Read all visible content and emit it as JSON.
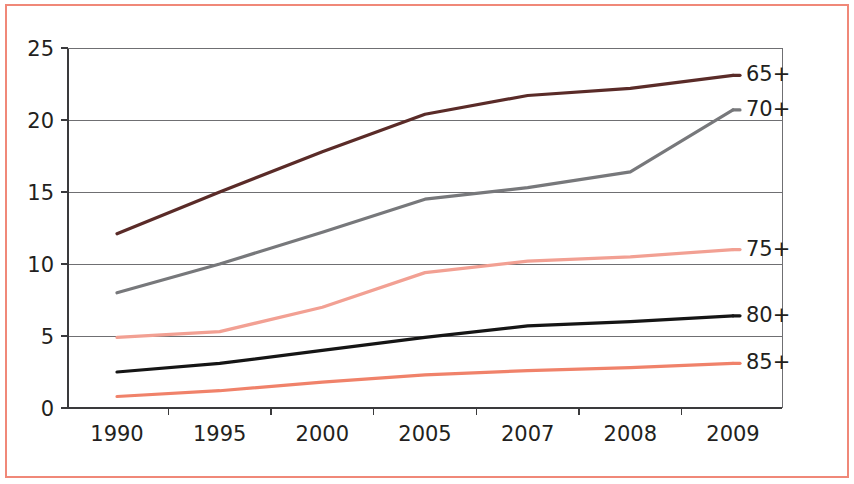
{
  "figure": {
    "background_color": "#ffffff",
    "frame_color": "#f08878"
  },
  "chart_data": {
    "type": "line",
    "title": "",
    "subtitle": "",
    "xlabel": "",
    "ylabel": "",
    "categories": [
      "1990",
      "1995",
      "2000",
      "2005",
      "2007",
      "2008",
      "2009"
    ],
    "ylim": [
      0,
      25
    ],
    "yticks": [
      "0",
      "5",
      "10",
      "15",
      "20",
      "25"
    ],
    "ytick_values": [
      0,
      5,
      10,
      15,
      20,
      25
    ],
    "grid": true,
    "grid_axis": "y",
    "legend_position": "right-inline-end-labels",
    "series": [
      {
        "name": "65+",
        "label": "65+",
        "color": "#5a2b28",
        "values": [
          12.1,
          15.0,
          17.8,
          20.4,
          21.7,
          22.2,
          23.1
        ]
      },
      {
        "name": "70+",
        "label": "70+",
        "color": "#77787b",
        "values": [
          8.0,
          10.0,
          12.2,
          14.5,
          15.3,
          16.4,
          20.7
        ]
      },
      {
        "name": "75+",
        "label": "75+",
        "color": "#f2a093",
        "values": [
          4.9,
          5.3,
          7.0,
          9.4,
          10.2,
          10.5,
          11.0
        ]
      },
      {
        "name": "80+",
        "label": "80+",
        "color": "#151515",
        "values": [
          2.5,
          3.1,
          4.0,
          4.9,
          5.7,
          6.0,
          6.4
        ]
      },
      {
        "name": "85+",
        "label": "85+",
        "color": "#f0826a",
        "values": [
          0.8,
          1.2,
          1.8,
          2.3,
          2.6,
          2.8,
          3.1
        ]
      }
    ]
  }
}
